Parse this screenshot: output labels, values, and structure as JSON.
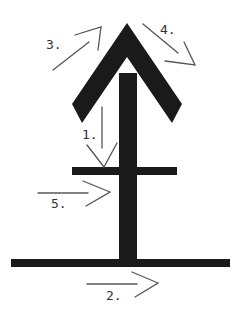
{
  "diagram": {
    "type": "stroke-order",
    "colors": {
      "stroke": "#1a1a1a",
      "guide": "#555555",
      "background": "#ffffff"
    },
    "strokes": [
      {
        "id": "1",
        "label": "1.",
        "meaning": "vertical stem drawn top to bottom"
      },
      {
        "id": "2",
        "label": "2.",
        "meaning": "bottom horizontal bar drawn left to right"
      },
      {
        "id": "3",
        "label": "3.",
        "meaning": "left arrowhead stroke drawn upward to tip"
      },
      {
        "id": "4",
        "label": "4.",
        "meaning": "right arrowhead stroke drawn down from tip"
      },
      {
        "id": "5",
        "label": "5.",
        "meaning": "middle horizontal crossbar drawn left to right"
      }
    ]
  }
}
